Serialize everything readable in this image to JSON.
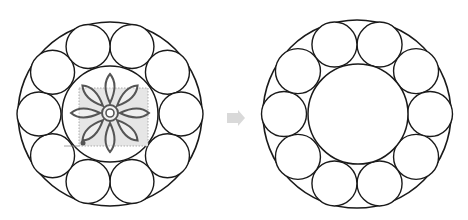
{
  "canvas": {
    "width": 468,
    "height": 220,
    "background": "#ffffff"
  },
  "colors": {
    "stroke": "#1a1a1a",
    "flower_stroke": "#555555",
    "flower_fill": "#ffffff",
    "selection_fill": "#e6e6e6",
    "selection_stroke": "#9a9a9a",
    "arrow": "#d9d9d9",
    "guide_line": "#8a8a8a"
  },
  "figures": [
    {
      "id": "before",
      "label": "ring-with-flower",
      "outer": {
        "cx": 110,
        "cy": 114,
        "r": 92
      },
      "inner": {
        "cx": 110,
        "cy": 114,
        "r": 48
      },
      "small_circles": {
        "count": 10,
        "orbit_r": 71,
        "r": 22,
        "start_angle_deg": -72
      },
      "flower": {
        "cx": 110,
        "cy": 113,
        "petals": 8,
        "petal_length": 39,
        "petal_width": 9,
        "center_ring_outer_r": 8,
        "center_ring_inner_r": 4
      },
      "selection_box": {
        "x": 79,
        "y": 88,
        "w": 69,
        "h": 58
      },
      "handle": {
        "cx": 83,
        "cy": 143,
        "r": 2.5
      },
      "guide_line": {
        "x1": 64,
        "y1": 146,
        "x2": 79,
        "y2": 146
      }
    },
    {
      "id": "after",
      "label": "ring-empty-center",
      "outer": {
        "cx": 357,
        "cy": 114,
        "r": 94
      },
      "inner": {
        "cx": 358,
        "cy": 114,
        "r": 50
      },
      "small_circles": {
        "count": 10,
        "orbit_r": 73,
        "r": 22.5,
        "start_angle_deg": -72
      }
    }
  ],
  "arrow": {
    "x": 227,
    "y": 110,
    "body_w": 11,
    "body_h": 10,
    "head_w": 7,
    "head_h": 16,
    "direction": "right"
  }
}
